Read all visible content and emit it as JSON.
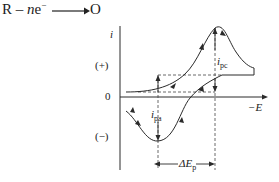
{
  "equation": {
    "reactant": "R",
    "minus": " – ",
    "n": "n",
    "electron": "e",
    "electron_charge": "−",
    "product": "O"
  },
  "axes": {
    "y_label": "i",
    "x_label": "−E",
    "zero_label": "0",
    "positive_label": "(+)",
    "negative_label": "(−)"
  },
  "annotations": {
    "ipc_main": "i",
    "ipc_sub": "pc",
    "ipa_main": "i",
    "ipa_sub": "pa",
    "delta_ep_main": "ΔE",
    "delta_ep_sub": "p"
  },
  "colors": {
    "line": "#2a2a2a",
    "dashed": "#444444",
    "background": "#ffffff"
  }
}
